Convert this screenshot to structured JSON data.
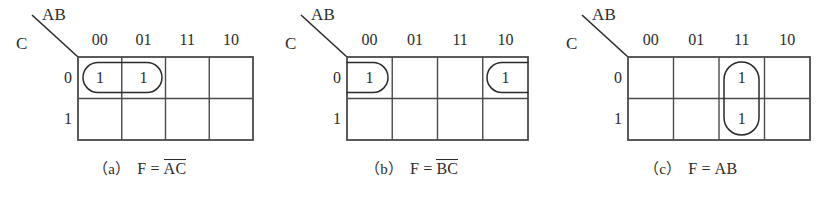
{
  "figure": {
    "type": "karnaugh-map-set",
    "variables": [
      "A",
      "B",
      "C"
    ],
    "column_header_label": "AB",
    "row_header_label": "C",
    "column_headers": [
      "00",
      "01",
      "11",
      "10"
    ],
    "row_headers": [
      "0",
      "1"
    ],
    "cell_value_one": "1",
    "cell_value_blank": "",
    "ink_color": "#2b2b2b",
    "background_color": "#ffffff"
  },
  "maps": [
    {
      "id": "map-a",
      "caption_index": "（a）",
      "caption_lhs": "F",
      "caption_eq": "=",
      "caption_terms": [
        {
          "text": "A",
          "overbar": true
        },
        {
          "text": "C",
          "overbar": true
        }
      ],
      "caption_plain": "（a）F = A̅C̅",
      "cells": [
        {
          "row": "0",
          "col": "00",
          "value": "1"
        },
        {
          "row": "0",
          "col": "01",
          "value": "1"
        },
        {
          "row": "0",
          "col": "11",
          "value": ""
        },
        {
          "row": "0",
          "col": "10",
          "value": ""
        },
        {
          "row": "1",
          "col": "00",
          "value": ""
        },
        {
          "row": "1",
          "col": "01",
          "value": ""
        },
        {
          "row": "1",
          "col": "11",
          "value": ""
        },
        {
          "row": "1",
          "col": "10",
          "value": ""
        }
      ],
      "groups": [
        {
          "name": "group-row0-col00-col01",
          "shape": "stadium",
          "wrap": false,
          "covers": [
            "0/00",
            "0/01"
          ]
        }
      ]
    },
    {
      "id": "map-b",
      "caption_index": "（b）",
      "caption_lhs": "F",
      "caption_eq": "=",
      "caption_terms": [
        {
          "text": "B",
          "overbar": true
        },
        {
          "text": "C",
          "overbar": true
        }
      ],
      "caption_plain": "（b）F = B̅C̅",
      "cells": [
        {
          "row": "0",
          "col": "00",
          "value": "1"
        },
        {
          "row": "0",
          "col": "01",
          "value": ""
        },
        {
          "row": "0",
          "col": "11",
          "value": ""
        },
        {
          "row": "0",
          "col": "10",
          "value": "1"
        },
        {
          "row": "1",
          "col": "00",
          "value": ""
        },
        {
          "row": "1",
          "col": "01",
          "value": ""
        },
        {
          "row": "1",
          "col": "11",
          "value": ""
        },
        {
          "row": "1",
          "col": "10",
          "value": ""
        }
      ],
      "groups": [
        {
          "name": "group-row0-col00-wrap-left",
          "shape": "half-stadium-right-rounded",
          "wrap": true,
          "covers": [
            "0/00"
          ]
        },
        {
          "name": "group-row0-col10-wrap-right",
          "shape": "half-stadium-left-rounded",
          "wrap": true,
          "covers": [
            "0/10"
          ]
        }
      ]
    },
    {
      "id": "map-c",
      "caption_index": "（c）",
      "caption_lhs": "F",
      "caption_eq": "=",
      "caption_terms": [
        {
          "text": "A",
          "overbar": false
        },
        {
          "text": "B",
          "overbar": false
        }
      ],
      "caption_plain": "（c）F = AB",
      "cells": [
        {
          "row": "0",
          "col": "00",
          "value": ""
        },
        {
          "row": "0",
          "col": "01",
          "value": ""
        },
        {
          "row": "0",
          "col": "11",
          "value": "1"
        },
        {
          "row": "0",
          "col": "10",
          "value": ""
        },
        {
          "row": "1",
          "col": "00",
          "value": ""
        },
        {
          "row": "1",
          "col": "01",
          "value": ""
        },
        {
          "row": "1",
          "col": "11",
          "value": "1"
        },
        {
          "row": "1",
          "col": "10",
          "value": ""
        }
      ],
      "groups": [
        {
          "name": "group-col11-row0-row1",
          "shape": "stadium-vertical",
          "wrap": false,
          "covers": [
            "0/11",
            "1/11"
          ]
        }
      ]
    }
  ]
}
